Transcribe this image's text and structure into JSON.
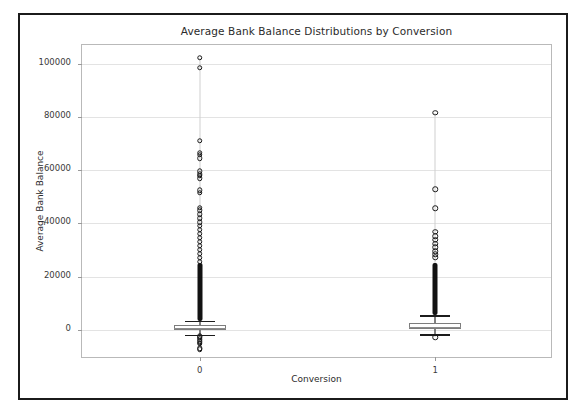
{
  "figure": {
    "title": "Average Bank Balance Distributions by Conversion",
    "background": "#ffffff",
    "border_color": "#1b1b1b"
  },
  "chart_data": {
    "type": "box",
    "title": "Average Bank Balance Distributions by Conversion",
    "xlabel": "Conversion",
    "ylabel": "Average Bank Balance",
    "categories": [
      "0",
      "1"
    ],
    "yticks": [
      0,
      20000,
      40000,
      60000,
      80000,
      100000
    ],
    "ytick_labels": [
      "0",
      "20000",
      "40000",
      "60000",
      "80000",
      "100000"
    ],
    "ylim": [
      -11000,
      107000
    ],
    "grid": true,
    "grid_axis": "y",
    "legend": null,
    "series": [
      {
        "name": "0",
        "whisker_low": -1900,
        "q1": -150,
        "median": 550,
        "q3": 1700,
        "whisker_high": 3400,
        "outliers_high_max": 102300,
        "outliers_low_min": -7300,
        "outlier_notable_high": [
          102300,
          98500,
          71000,
          66500,
          65800,
          64500,
          59500,
          58500,
          57800,
          57000,
          52500,
          51500,
          45800,
          45000,
          43500,
          42000,
          40500,
          39000,
          37500,
          36000,
          34500,
          33000,
          31500,
          30000,
          28500,
          27000,
          25500,
          24000,
          22500,
          21000,
          19500,
          18000,
          16500,
          15000,
          13500,
          12000,
          10500,
          9000,
          7500,
          6000,
          4800,
          4000
        ],
        "outlier_notable_low": [
          -7300,
          -6900,
          -5200,
          -4800,
          -4300,
          -3500,
          -2900,
          -2400
        ]
      },
      {
        "name": "1",
        "whisker_low": -1600,
        "q1": 350,
        "median": 1150,
        "q3": 2400,
        "whisker_high": 5400,
        "outliers_high_max": 81500,
        "outliers_low_min": -2900,
        "outlier_notable_high": [
          81500,
          52800,
          45700,
          36800,
          35200,
          33800,
          32400,
          31000,
          29600,
          28400,
          27200,
          24500,
          23000,
          21500,
          20000,
          18500,
          17000,
          15500,
          14000,
          12500,
          11000,
          9500,
          8200,
          7000,
          6200
        ],
        "outlier_notable_low": [
          -2900
        ]
      }
    ]
  },
  "axes": {
    "x_tick_labels": [
      "0",
      "1"
    ],
    "y_tick_labels": [
      "100000",
      "80000",
      "60000",
      "40000",
      "20000",
      "0"
    ]
  }
}
